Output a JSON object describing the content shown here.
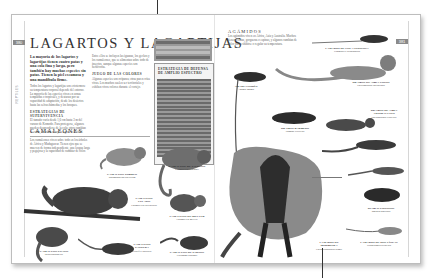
{
  "book": {
    "left_page_number": "380",
    "right_page_number": "381",
    "running_head_vertical": "REPTILES"
  },
  "left_page": {
    "title": "LAGARTOS Y LAGARTIJAS",
    "lede": "La mayoría de los lagartos y lagartijas tienen cuatro patas y una cola fina y larga, pero también hay muchas especies sin patas. Tienen la piel escamosa y una mandíbula firme.",
    "body_col1": [
      "Todos los lagartos y lagartijas son ectotermos: su temperatura corporal depende del entorno. La mayoría de las especies viven en zonas templadas o tropicales, y destacan por su capacidad de adaptación, desde los desiertos hasta las selvas húmedas y los bosques."
    ],
    "subhead_col1": "ESTRATEGIAS DE SUPERVIVENCIA",
    "body_col1b": [
      "El tamaño varía desde 1,6 cm hasta 3 m del varano de Komodo. Para protegerse, algunos pueden desprenderse de la cola; otros cambian de color, se inflan o huyen a gran velocidad."
    ],
    "body_col2": [
      "Entre ellos se incluyen las iguanas, los geckos y los camaleones, que se alimentan sobre todo de insectos, aunque algunas especies son herbívoras."
    ],
    "subhead_col2": "JUEGO DE LAS COLORES",
    "body_col2b": [
      "Algunas especies son ovíparas; otras paren crías vivas. Los machos suelen ser territoriales y exhiben vivos colores durante el cortejo."
    ],
    "sidebar": {
      "table_rows": [
        "Filo",
        "Clase",
        "Orden",
        "Suborden",
        "Familias"
      ],
      "defense_title": "ESTRATEGIA DE DEFENSA DE AMPLIO ESPECTRO",
      "defense_text": "Muchos lagartos utilizan una combinación de estrategias para evitar a los depredadores."
    },
    "section_chameleons": {
      "heading": "CAMALEONES",
      "text": "Los camaleones viven sobre todo en los árboles de África y Madagascar. Tienen ojos que se mueven de forma independiente, una lengua larga y pegajosa y la capacidad de cambiar de color."
    },
    "captions": [
      {
        "name": "CAMALEÓN PIGMEO",
        "text": "Rhampholeon spectrum"
      },
      {
        "name": "CAMALEÓN DE JACKSON",
        "text": "Chamaeleo jacksonii"
      },
      {
        "name": "CAMALEÓN VELADO",
        "text": "Chamaeleo calyptratus"
      },
      {
        "name": "CAMALEÓN DE MELLER",
        "text": "Chamaeleo melleri"
      },
      {
        "name": "CAMALEÓN PANTERA",
        "text": "Furcifer pardalis"
      },
      {
        "name": "CAMALEÓN ENANO",
        "text": "Bradypodion sp."
      },
      {
        "name": "CAMALEÓN DE PARSON",
        "text": "Calumma parsonii"
      }
    ]
  },
  "right_page": {
    "section_agamids": {
      "heading": "AGÁMIDOS",
      "text": "Los agámidos viven en África, Asia y Australia. Muchos tienen crestas, gorgueras o espinas, y algunos cambian de color para exhibirse o regular su temperatura."
    },
    "captions": [
      {
        "name": "LAGARTO DE COLA ESPINOSA",
        "text": "Uromastyx acanthinura"
      },
      {
        "name": "DRAGÓN DE AGUA CHINO",
        "text": "Physignathus cocincinus"
      },
      {
        "name": "DRAGÓN BARBUDO",
        "text": "Pogona vitticeps"
      },
      {
        "name": "AGAMA COMÚN",
        "text": "Agama agama"
      },
      {
        "name": "DRAGÓN DE AGUA AUSTRALIANO",
        "text": "Physignathus lesueurii"
      },
      {
        "name": "DIABLO ESPINOSO",
        "text": "Moloch horridus"
      },
      {
        "name": "LAGARTO DE GORGUERA",
        "text": "Chlamydosaurus kingii"
      },
      {
        "name": "LAGARTO DE DOS LÍNEAS",
        "text": "Diporiphora bilineata"
      }
    ]
  }
}
